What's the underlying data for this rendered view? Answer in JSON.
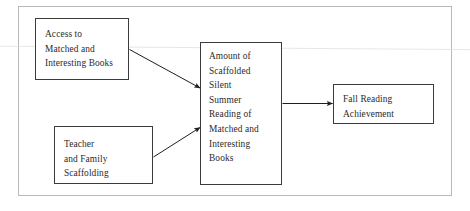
{
  "figure": {
    "type": "flow-diagram",
    "background_color": "#ffffff",
    "frame_color": "#b9b9b9",
    "box_border_color": "#3b3b3b",
    "text_color": "#2b2b2b",
    "arrow_color": "#1f1f1f"
  },
  "nodes": [
    {
      "id": "access",
      "label": "Access to\nMatched and\nInteresting Books",
      "lines": [
        "Access to",
        "Matched and",
        "Interesting Books"
      ]
    },
    {
      "id": "teacher",
      "label": "Teacher\nand Family\nScaffolding",
      "lines": [
        "Teacher",
        "and Family",
        "Scaffolding"
      ]
    },
    {
      "id": "amount",
      "label": "Amount of\nScaffolded\nSilent\nSummer\nReading of\nMatched and\nInteresting\nBooks",
      "lines": [
        "Amount of",
        "Scaffolded",
        "Silent",
        "Summer",
        "Reading of",
        "Matched and",
        "Interesting",
        "Books"
      ]
    },
    {
      "id": "fall",
      "label": "Fall Reading\nAchievement",
      "lines": [
        "Fall Reading",
        "Achievement"
      ]
    }
  ],
  "edges": [
    {
      "id": "access-to-amount",
      "from": "access",
      "to": "amount",
      "style": "solid-arrow",
      "direction": "down-right"
    },
    {
      "id": "teacher-to-amount",
      "from": "teacher",
      "to": "amount",
      "style": "solid-arrow",
      "direction": "up-right"
    },
    {
      "id": "amount-to-fall",
      "from": "amount",
      "to": "fall",
      "style": "solid-arrow",
      "direction": "right"
    }
  ]
}
